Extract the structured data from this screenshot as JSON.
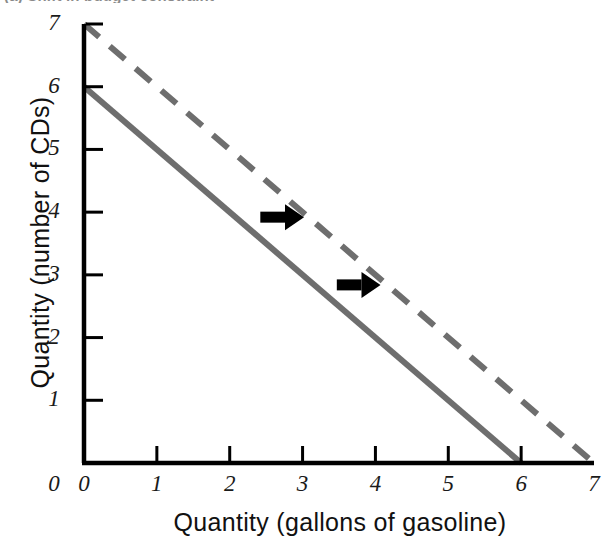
{
  "caption_fragment": "(a) Shift in budget constraint",
  "chart_data": {
    "type": "line",
    "title": "",
    "subtitle": "",
    "xlabel": "Quantity (gallons of gasoline)",
    "ylabel": "Quantity (number of CDs)",
    "xlim": [
      0,
      7
    ],
    "ylim": [
      0,
      7
    ],
    "xticks": [
      0,
      1,
      2,
      3,
      4,
      5,
      6,
      7
    ],
    "yticks": [
      0,
      1,
      2,
      3,
      4,
      5,
      6,
      7
    ],
    "xtick_labels": [
      "0",
      "1",
      "2",
      "3",
      "4",
      "5",
      "6",
      "7"
    ],
    "ytick_labels": [
      "0",
      "1",
      "2",
      "3",
      "4",
      "5",
      "6",
      "7"
    ],
    "grid": false,
    "legend": "none",
    "series": [
      {
        "name": "Original budget constraint",
        "style": "solid",
        "color": "#6e6e6e",
        "width": 6,
        "x": [
          0,
          6
        ],
        "values": [
          6,
          0
        ]
      },
      {
        "name": "New budget constraint",
        "style": "dashed",
        "color": "#6e6e6e",
        "width": 6,
        "dash_pattern": "20 14",
        "x": [
          0,
          7
        ],
        "values": [
          7,
          0
        ]
      }
    ],
    "annotations": [
      {
        "name": "shift-arrow-upper",
        "kind": "arrow",
        "color": "#000000",
        "direction": "right",
        "x_start": 2.42,
        "x_end": 3.02,
        "y": 3.92
      },
      {
        "name": "shift-arrow-lower",
        "kind": "arrow",
        "color": "#000000",
        "direction": "right",
        "x_start": 3.47,
        "x_end": 4.07,
        "y": 2.84
      }
    ],
    "axis_color": "#000000",
    "background": "#ffffff"
  }
}
